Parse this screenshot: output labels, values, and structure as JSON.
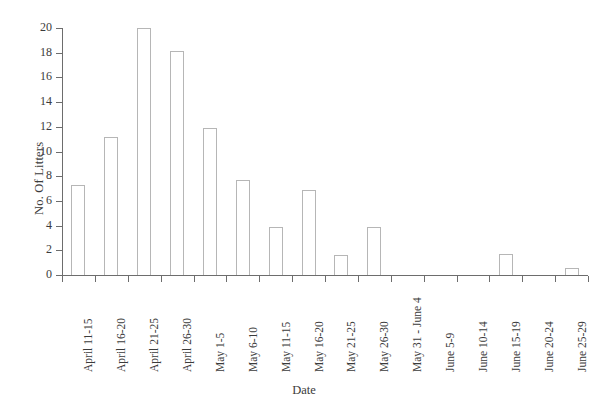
{
  "chart_data": {
    "type": "bar",
    "title": "",
    "xlabel": "Date",
    "ylabel": "No. Of Litters",
    "ylim": [
      0,
      20
    ],
    "ytick_step": 2,
    "yticks": [
      0,
      2,
      4,
      6,
      8,
      10,
      12,
      14,
      16,
      18,
      20
    ],
    "ytick_labels": [
      "0",
      "2",
      "4",
      "6",
      "8",
      "10",
      "12",
      "14",
      "16",
      "18",
      "20"
    ],
    "grid": false,
    "legend": false,
    "bar_face_color": "#ffffff",
    "bar_edge_color": "#b6b6b6",
    "axis_color": "#6d6d6d",
    "background_color": "#ffffff",
    "categories": [
      "April 11-15",
      "April 16-20",
      "April 21-25",
      "April 26-30",
      "May 1-5",
      "May 6-10",
      "May 11-15",
      "May 16-20",
      "May 21-25",
      "May 26-30",
      "May 31 - June 4",
      "June 5-9",
      "June 10-14",
      "June 15-19",
      "June 20-24",
      "June 25-29"
    ],
    "values": [
      7.3,
      11.2,
      20.0,
      18.1,
      11.9,
      7.7,
      3.9,
      6.9,
      1.6,
      3.9,
      0,
      0,
      0,
      1.7,
      0,
      0.6
    ]
  }
}
